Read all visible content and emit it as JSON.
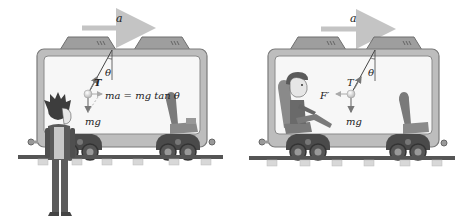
{
  "left_panel": {
    "acceleration_label": "a",
    "tension_label": "T",
    "angle_label": "θ",
    "weight_label": "mg",
    "equation": "ma = mg tan θ",
    "observer": "standing person outside car"
  },
  "right_panel": {
    "acceleration_label": "a",
    "tension_label": "T",
    "angle_label": "θ",
    "weight_label": "mg",
    "fictitious_force_label": "F′",
    "observer": "seated person inside car"
  },
  "colors": {
    "car_body": "#bdbdbd",
    "car_outline": "#7a7a7a",
    "window": "#f7f7f7",
    "arrow": "#c4c4c4",
    "rail": "#555555",
    "sleeper": "#d8d8d8",
    "wheel": "#3a3a3a"
  }
}
